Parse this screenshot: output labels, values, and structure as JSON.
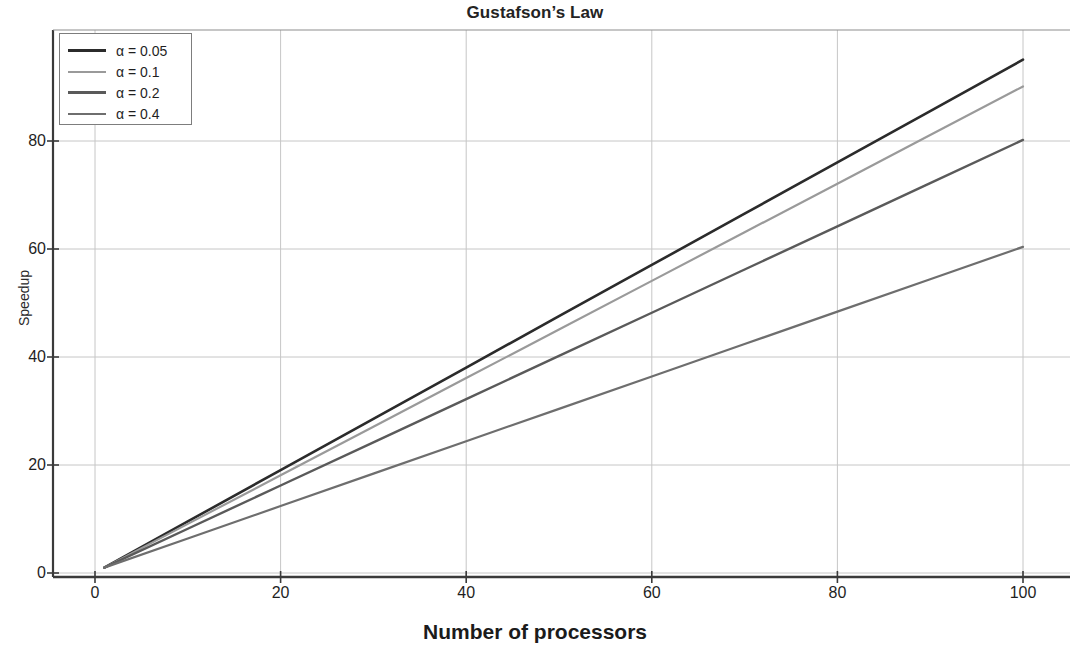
{
  "chart_data": {
    "type": "line",
    "title": "Gustafson’s Law",
    "xlabel": "Number of processors",
    "ylabel": "Speedup",
    "xlim": [
      0,
      104
    ],
    "ylim": [
      -4,
      97
    ],
    "grid": true,
    "legend_position": "upper-left",
    "xticks": [
      0,
      20,
      40,
      60,
      80,
      100
    ],
    "xtick_labels": [
      "0",
      "20",
      "40",
      "60",
      "80",
      "100"
    ],
    "yticks": [
      0,
      20,
      40,
      60,
      80
    ],
    "ytick_labels": [
      "0",
      "20",
      "40",
      "60",
      "80"
    ],
    "x": [
      1,
      10,
      20,
      30,
      40,
      50,
      60,
      70,
      80,
      90,
      100
    ],
    "series": [
      {
        "name": "α = 0.05",
        "alpha": 0.05,
        "color": "#2b2b2b",
        "values": [
          1,
          9.55,
          19.05,
          28.55,
          38.05,
          47.55,
          57.05,
          66.55,
          76.05,
          85.55,
          95.05
        ]
      },
      {
        "name": "α = 0.1",
        "alpha": 0.1,
        "color": "#9a9a9a",
        "values": [
          1,
          9.1,
          18.1,
          27.1,
          36.1,
          45.1,
          54.1,
          63.1,
          72.1,
          81.1,
          90.1
        ]
      },
      {
        "name": "α = 0.2",
        "alpha": 0.2,
        "color": "#5a5a5a",
        "values": [
          1,
          8.2,
          16.2,
          24.2,
          32.2,
          40.2,
          48.2,
          56.2,
          64.2,
          72.2,
          80.2
        ]
      },
      {
        "name": "α = 0.4",
        "alpha": 0.4,
        "color": "#6e6e6e",
        "values": [
          1,
          6.4,
          12.4,
          18.4,
          24.4,
          30.4,
          36.4,
          42.4,
          48.4,
          54.4,
          60.4
        ]
      }
    ],
    "axis_color": "#3a3a3a",
    "grid_color": "#c6c6c6",
    "background": "#ffffff"
  }
}
